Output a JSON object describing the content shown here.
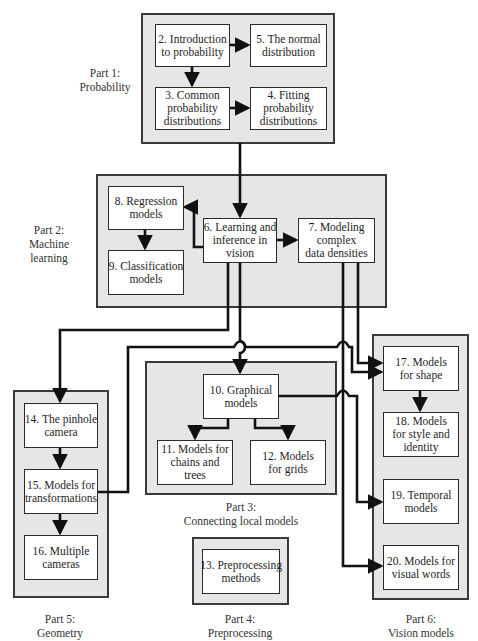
{
  "parts": [
    {
      "id": "part1",
      "label_line1": "Part 1:",
      "label_line2": "Probability"
    },
    {
      "id": "part2",
      "label_line1": "Part 2:",
      "label_line2": "Machine",
      "label_line3": "learning"
    },
    {
      "id": "part3",
      "label_line1": "Part 3:",
      "label_line2": "Connecting local models"
    },
    {
      "id": "part4",
      "label_line1": "Part 4:",
      "label_line2": "Preprocessing"
    },
    {
      "id": "part5",
      "label_line1": "Part 5:",
      "label_line2": "Geometry"
    },
    {
      "id": "part6",
      "label_line1": "Part 6:",
      "label_line2": "Vision models"
    }
  ],
  "nodes": {
    "n2": {
      "lines": [
        "2. Introduction",
        "to probability"
      ]
    },
    "n3": {
      "lines": [
        "3. Common",
        "probability",
        "distributions"
      ]
    },
    "n4": {
      "lines": [
        "4. Fitting",
        "probability",
        "distributions"
      ]
    },
    "n5": {
      "lines": [
        "5. The normal",
        "distribution"
      ]
    },
    "n6": {
      "lines": [
        "6. Learning and",
        "inference in",
        "vision"
      ]
    },
    "n7": {
      "lines": [
        "7. Modeling",
        "complex",
        "data densities"
      ]
    },
    "n8": {
      "lines": [
        "8. Regression",
        "models"
      ]
    },
    "n9": {
      "lines": [
        "9. Classification",
        "models"
      ]
    },
    "n10": {
      "lines": [
        "10.  Graphical",
        "models"
      ]
    },
    "n11": {
      "lines": [
        "11. Models for",
        "chains and",
        "trees"
      ]
    },
    "n12": {
      "lines": [
        "12. Models",
        "for grids"
      ]
    },
    "n13": {
      "lines": [
        "13. Preprocessing",
        "methods"
      ]
    },
    "n14": {
      "lines": [
        "14. The pinhole",
        "camera"
      ]
    },
    "n15": {
      "lines": [
        "15. Models for",
        "transformations"
      ]
    },
    "n16": {
      "lines": [
        "16. Multiple",
        "cameras"
      ]
    },
    "n17": {
      "lines": [
        "17. Models",
        "for shape"
      ]
    },
    "n18": {
      "lines": [
        "18. Models",
        "for style and",
        "identity"
      ]
    },
    "n19": {
      "lines": [
        "19. Temporal",
        "models"
      ]
    },
    "n20": {
      "lines": [
        "20. Models for",
        "visual words"
      ]
    }
  },
  "edges": [
    {
      "from": "2",
      "to": "5"
    },
    {
      "from": "2",
      "to": "3"
    },
    {
      "from": "3",
      "to": "4"
    },
    {
      "from": "part1",
      "to": "6"
    },
    {
      "from": "6",
      "to": "8"
    },
    {
      "from": "8",
      "to": "9"
    },
    {
      "from": "6",
      "to": "7"
    },
    {
      "from": "6",
      "to": "14"
    },
    {
      "from": "6",
      "to": "10"
    },
    {
      "from": "7",
      "to": "17"
    },
    {
      "from": "7",
      "to": "20"
    },
    {
      "from": "15",
      "to": "17"
    },
    {
      "from": "10",
      "to": "11"
    },
    {
      "from": "10",
      "to": "12"
    },
    {
      "from": "10",
      "to": "19"
    },
    {
      "from": "14",
      "to": "15"
    },
    {
      "from": "15",
      "to": "16"
    },
    {
      "from": "17",
      "to": "18"
    }
  ],
  "colors": {
    "part_fill": "#e6e6e6",
    "node_fill": "#ffffff",
    "line": "#111111"
  }
}
